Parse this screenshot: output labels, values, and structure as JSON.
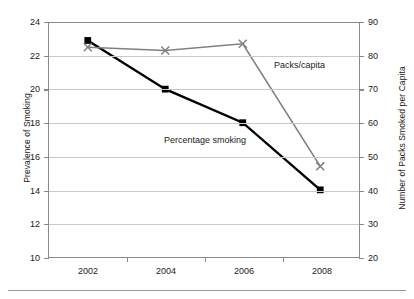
{
  "chart_data": {
    "type": "line",
    "title": "",
    "categories": [
      "2002",
      "2004",
      "2006",
      "2008"
    ],
    "series": [
      {
        "name": "Percentage smoking",
        "axis": "left",
        "color": "#000000",
        "marker": "square",
        "values": [
          22.9,
          20.0,
          18.0,
          14.0
        ]
      },
      {
        "name": "Packs/capita",
        "axis": "right",
        "color": "#808080",
        "marker": "x",
        "values": [
          82.5,
          81.5,
          83.5,
          47.0
        ]
      }
    ],
    "xlabel": "",
    "ylabel": "Prevalence of Smoking",
    "y2label": "Number of Packs Smoked per Capita",
    "ylim": [
      10,
      24
    ],
    "y2lim": [
      20,
      90
    ],
    "yticks": [
      10,
      12,
      14,
      16,
      18,
      20,
      22,
      24
    ],
    "y2ticks": [
      20,
      30,
      40,
      50,
      60,
      70,
      80,
      90
    ],
    "grid": true,
    "legend": "annotations-inline",
    "annotations": [
      {
        "text": "Packs/capita",
        "series": "Packs/capita"
      },
      {
        "text": "Percentage smoking",
        "series": "Percentage smoking"
      }
    ]
  },
  "axes": {
    "left_title": "Prevalence of Smoking",
    "right_title": "Number of Packs Smoked per Capita",
    "left_ticks": [
      "24",
      "22",
      "20",
      "18",
      "16",
      "14",
      "12",
      "10"
    ],
    "right_ticks": [
      "90",
      "80",
      "70",
      "60",
      "50",
      "40",
      "30",
      "20"
    ],
    "x_ticks": [
      "2002",
      "2004",
      "2006",
      "2008"
    ]
  },
  "annotations": {
    "packs": "Packs/capita",
    "percentage": "Percentage smoking"
  },
  "colors": {
    "series_black": "#000000",
    "series_gray": "#808080",
    "grid": "#c9c9c9",
    "axis": "#8a8a8a"
  }
}
